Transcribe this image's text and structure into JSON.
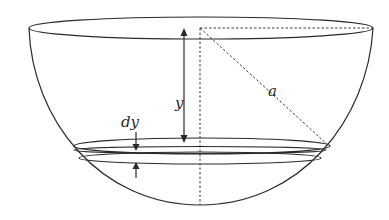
{
  "figure": {
    "labels": {
      "depth": "y",
      "thickness": "dy",
      "radius": "a"
    }
  }
}
